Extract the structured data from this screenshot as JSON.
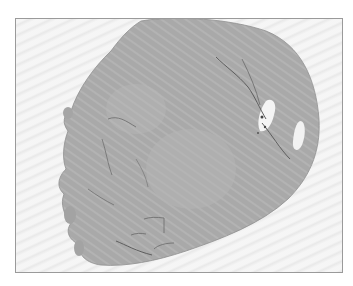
{
  "figure": {
    "type": "whole-slide histology section (grayscale)",
    "frame_color": "#9a9a9a",
    "background_color": "#f1f1f1",
    "tissue_color": "#a9a9a9",
    "tissue_dark_color": "#8c8c8c",
    "lumen_color": "#f4f4f4",
    "icon": "tissue-section-image"
  },
  "caption": {
    "label": "",
    "text": "",
    "note": "caption text clipped at bottom edge; illegible"
  }
}
